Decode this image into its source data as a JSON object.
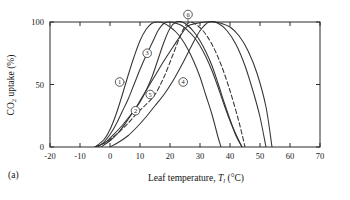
{
  "figure": {
    "panel_label": "(a)",
    "background": "#ffffff",
    "curve_color": "#333333",
    "axis_color": "#2b2b2b"
  },
  "chart_data": {
    "type": "line",
    "title": "",
    "xlabel": "Leaf temperature,  T_l (°C)",
    "xlabel_parts": {
      "prefix": "Leaf temperature,  ",
      "symbol": "T",
      "subscript": "l",
      "units": " (°C)"
    },
    "ylabel": "CO2 uptake (%)",
    "ylabel_parts": {
      "prefix": "CO",
      "subscript": "2",
      "suffix": " uptake (%)"
    },
    "xlim": [
      -20,
      70
    ],
    "ylim": [
      0,
      100
    ],
    "xticks": [
      -20,
      -10,
      0,
      10,
      20,
      30,
      40,
      50,
      60,
      70
    ],
    "xticklabels": [
      "-20",
      "-10",
      "0",
      "10",
      "20",
      "30",
      "40",
      "50",
      "60",
      "70"
    ],
    "yticks": [
      0,
      50,
      100
    ],
    "yticklabels": [
      "0",
      "50",
      "100"
    ],
    "grid": false,
    "legend": "none",
    "annotations_note": "Each curve carries a small circled index number placed on its rising limb",
    "series": [
      {
        "name": "1",
        "label": "1",
        "style": "solid",
        "optimum_c": 14,
        "marker_point": [
          5,
          52
        ],
        "marker_label_point": [
          3.2,
          52
        ],
        "x": [
          -5,
          -2,
          0,
          2,
          4,
          6,
          8,
          10,
          12,
          14,
          16,
          18,
          20,
          22,
          24,
          26,
          28,
          30,
          32,
          34,
          36,
          37
        ],
        "y": [
          0,
          6,
          14,
          26,
          41,
          57,
          72,
          85,
          94,
          99,
          100,
          99,
          96,
          92,
          86,
          78,
          68,
          56,
          41,
          26,
          8,
          0
        ]
      },
      {
        "name": "2",
        "label": "2",
        "style": "solid",
        "optimum_c": 22,
        "marker_point": [
          10,
          29
        ],
        "marker_label_point": [
          8.5,
          29
        ],
        "x": [
          -5,
          -2,
          0,
          2,
          4,
          6,
          8,
          10,
          12,
          14,
          16,
          18,
          20,
          22,
          24,
          26,
          28,
          30,
          32,
          34,
          36,
          38,
          40,
          42,
          44
        ],
        "y": [
          0,
          3,
          7,
          12,
          17,
          23,
          29,
          36,
          45,
          56,
          70,
          84,
          95,
          100,
          100,
          97,
          92,
          85,
          76,
          65,
          51,
          36,
          22,
          9,
          0
        ]
      },
      {
        "name": "3",
        "label": "3",
        "style": "solid",
        "optimum_c": 19,
        "marker_point": [
          14,
          75
        ],
        "marker_label_point": [
          12.4,
          75
        ],
        "x": [
          -4,
          -2,
          0,
          2,
          4,
          6,
          8,
          10,
          12,
          14,
          16,
          18,
          20,
          22,
          24,
          26,
          28,
          30,
          32,
          34,
          36,
          38,
          40,
          42,
          44
        ],
        "y": [
          0,
          4,
          10,
          18,
          28,
          38,
          50,
          62,
          73,
          83,
          93,
          99,
          100,
          99,
          97,
          93,
          88,
          81,
          72,
          61,
          48,
          34,
          21,
          10,
          0
        ]
      },
      {
        "name": "4",
        "label": "4",
        "style": "solid",
        "optimum_c": 33,
        "marker_point": [
          26,
          52
        ],
        "marker_label_point": [
          24.4,
          52
        ],
        "x": [
          0,
          3,
          6,
          9,
          12,
          15,
          18,
          21,
          24,
          27,
          30,
          33,
          36,
          39,
          42,
          45,
          48,
          50,
          52
        ],
        "y": [
          0,
          4,
          9,
          16,
          24,
          33,
          42,
          53,
          66,
          80,
          93,
          100,
          99,
          93,
          82,
          65,
          42,
          24,
          0
        ]
      },
      {
        "name": "5",
        "label": "5",
        "style": "dashed",
        "optimum_c": 26,
        "marker_point": [
          15,
          42
        ],
        "marker_label_point": [
          13.4,
          42
        ],
        "x": [
          -5,
          -2,
          0,
          3,
          6,
          9,
          12,
          15,
          18,
          21,
          24,
          26,
          28,
          31,
          34,
          37,
          40,
          43,
          45
        ],
        "y": [
          0,
          3,
          6,
          12,
          19,
          27,
          34,
          42,
          56,
          74,
          92,
          99,
          99,
          93,
          82,
          66,
          45,
          20,
          0
        ]
      },
      {
        "name": "6",
        "label": "6",
        "style": "solid",
        "optimum_c": 36,
        "marker_point": [
          26,
          100
        ],
        "marker_label_point": [
          26,
          106
        ],
        "x": [
          -3,
          0,
          3,
          6,
          9,
          12,
          15,
          18,
          21,
          24,
          26,
          29,
          32,
          35,
          37,
          40,
          43,
          46,
          49,
          52,
          54
        ],
        "y": [
          0,
          5,
          12,
          22,
          33,
          45,
          57,
          69,
          80,
          91,
          97,
          99,
          100,
          100,
          99,
          96,
          89,
          77,
          59,
          32,
          0
        ]
      }
    ]
  }
}
